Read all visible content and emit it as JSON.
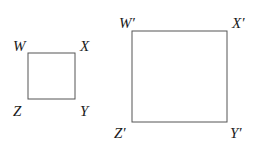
{
  "diagram": {
    "small_square": {
      "vertices": {
        "top_left": "W",
        "top_right": "X",
        "bottom_right": "Y",
        "bottom_left": "Z"
      }
    },
    "large_square": {
      "vertices": {
        "top_left": "W′",
        "top_right": "X′",
        "bottom_right": "Y′",
        "bottom_left": "Z′"
      }
    },
    "stroke_color": "#555555"
  }
}
